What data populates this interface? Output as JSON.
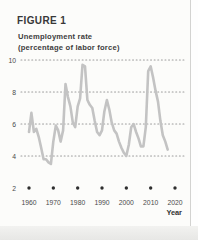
{
  "header": {
    "figure_label": "FIGURE 1",
    "title_line1": "Unemployment rate",
    "title_line2": "(percentage of labor force)"
  },
  "colors": {
    "page_bg": "#fcfcfa",
    "header_text": "#383838",
    "axis_text": "#4a4a4a",
    "grid_dot": "#9b9b9b",
    "tick_dot": "#2e2e2e",
    "series_line": "#c3c3c3"
  },
  "chart_data": {
    "type": "line",
    "title": "Unemployment rate (percentage of labor force)",
    "xlabel": "Year",
    "ylabel": "",
    "xlim": [
      1960,
      2020
    ],
    "ylim": [
      2,
      10
    ],
    "x_ticks": [
      1960,
      1970,
      1980,
      1990,
      2000,
      2010,
      2020
    ],
    "y_ticks": [
      2,
      4,
      6,
      8,
      10
    ],
    "grid": "dotted horizontal gridlines at 4, 6, 8, 10; dot markers along the 2 baseline at each decade",
    "legend": "none",
    "series": [
      {
        "name": "Unemployment rate",
        "x": [
          1960,
          1961,
          1962,
          1963,
          1964,
          1965,
          1966,
          1967,
          1968,
          1969,
          1970,
          1971,
          1972,
          1973,
          1974,
          1975,
          1976,
          1977,
          1978,
          1979,
          1980,
          1981,
          1982,
          1983,
          1984,
          1985,
          1986,
          1987,
          1988,
          1989,
          1990,
          1991,
          1992,
          1993,
          1994,
          1995,
          1996,
          1997,
          1998,
          1999,
          2000,
          2001,
          2002,
          2003,
          2004,
          2005,
          2006,
          2007,
          2008,
          2009,
          2010,
          2011,
          2012,
          2013,
          2014,
          2015,
          2016,
          2017
        ],
        "y": [
          5.5,
          6.7,
          5.5,
          5.7,
          5.2,
          4.5,
          3.8,
          3.8,
          3.6,
          3.5,
          4.9,
          5.9,
          5.6,
          4.9,
          5.6,
          8.5,
          7.7,
          7.1,
          6.1,
          5.8,
          7.1,
          7.6,
          9.7,
          9.6,
          7.5,
          7.2,
          7.0,
          6.2,
          5.5,
          5.3,
          5.6,
          6.8,
          7.5,
          6.9,
          6.1,
          5.6,
          5.4,
          4.9,
          4.5,
          4.2,
          4.0,
          4.7,
          5.8,
          6.0,
          5.5,
          5.1,
          4.6,
          4.6,
          5.8,
          9.3,
          9.6,
          8.9,
          8.1,
          7.4,
          6.2,
          5.3,
          4.9,
          4.4
        ]
      }
    ]
  }
}
